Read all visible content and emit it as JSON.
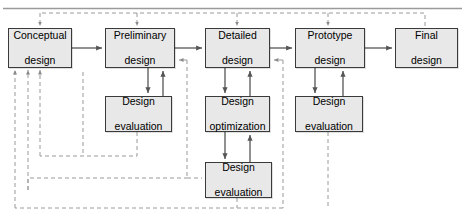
{
  "diagram": {
    "style": {
      "node_fill": "#e8e8e8",
      "node_stroke": "#3a3a3a",
      "solid_line": "#555555",
      "dashed_line": "#999999",
      "top_rule": "#9a9a9a",
      "background": "#ffffff"
    },
    "stages": [
      {
        "id": "conceptual-design",
        "label": "Conceptual\ndesign",
        "line1": "Conceptual",
        "line2": "design",
        "x": 8,
        "y": 28,
        "w": 64,
        "h": 40
      },
      {
        "id": "preliminary-design",
        "label": "Preliminary\ndesign",
        "line1": "Preliminary",
        "line2": "design",
        "x": 105,
        "y": 28,
        "w": 70,
        "h": 40
      },
      {
        "id": "detailed-design",
        "label": "Detailed\ndesign",
        "line1": "Detailed",
        "line2": "design",
        "x": 205,
        "y": 28,
        "w": 65,
        "h": 40
      },
      {
        "id": "prototype-design",
        "label": "Prototype\ndesign",
        "line1": "Prototype",
        "line2": "design",
        "x": 295,
        "y": 28,
        "w": 70,
        "h": 40
      },
      {
        "id": "final-design",
        "label": "Final\ndesign",
        "line1": "Final",
        "line2": "design",
        "x": 395,
        "y": 28,
        "w": 63,
        "h": 40
      }
    ],
    "sub_nodes": [
      {
        "id": "design-evaluation-preliminary",
        "line1": "Design",
        "line2": "evaluation",
        "x": 105,
        "y": 96,
        "w": 67,
        "h": 36
      },
      {
        "id": "design-optimization-detailed",
        "line1": "Design",
        "line2": "optimization",
        "x": 205,
        "y": 96,
        "w": 65,
        "h": 36
      },
      {
        "id": "design-evaluation-prototype",
        "line1": "Design",
        "line2": "evaluation",
        "x": 295,
        "y": 96,
        "w": 68,
        "h": 36
      },
      {
        "id": "design-evaluation-detailed",
        "line1": "Design",
        "line2": "evaluation",
        "x": 205,
        "y": 162,
        "w": 67,
        "h": 36
      }
    ]
  }
}
